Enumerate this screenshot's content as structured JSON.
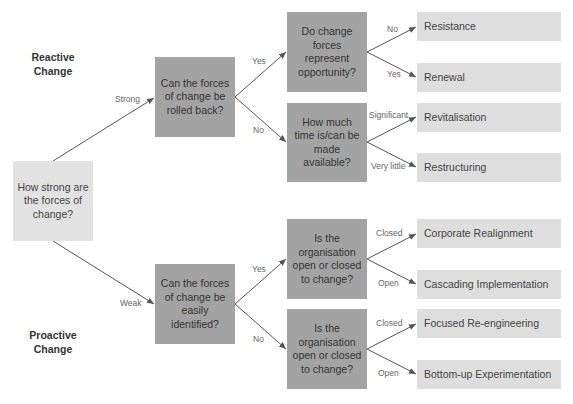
{
  "side_labels": {
    "reactive": "Reactive Change",
    "proactive": "Proactive Change"
  },
  "start": {
    "text": "How strong are the forces of change?"
  },
  "level1": [
    {
      "edge_label": "Strong",
      "text": "Can the forces of change be rolled back?"
    },
    {
      "edge_label": "Weak",
      "text": "Can the forces of change be easily identified?"
    }
  ],
  "level2": [
    {
      "edge_label": "Yes",
      "text": "Do change forces represent opportunity?"
    },
    {
      "edge_label": "No",
      "text": "How much time is/can be made available?"
    },
    {
      "edge_label": "Yes",
      "text": "Is the organisation open or closed to change?"
    },
    {
      "edge_label": "No",
      "text": "Is the organisation open or closed to change?"
    }
  ],
  "outcomes": [
    {
      "edge_label": "No",
      "text": "Resistance"
    },
    {
      "edge_label": "Yes",
      "text": "Renewal"
    },
    {
      "edge_label": "Significant",
      "text": "Revitalisation"
    },
    {
      "edge_label": "Very little",
      "text": "Restructuring"
    },
    {
      "edge_label": "Closed",
      "text": "Corporate Realignment"
    },
    {
      "edge_label": "Open",
      "text": "Cascading Implementation"
    },
    {
      "edge_label": "Closed",
      "text": "Focused Re-engineering"
    },
    {
      "edge_label": "Open",
      "text": "Bottom-up Experimentation"
    }
  ],
  "colors": {
    "question": "#a3a3a3",
    "outcome": "#dedede",
    "start": "#e2e2e2",
    "arrow": "#555555"
  }
}
